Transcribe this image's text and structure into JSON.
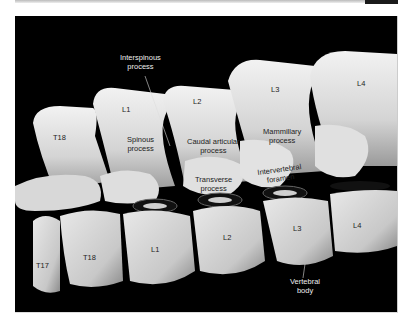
{
  "figure": {
    "type": "3D CT rendering of canine thoracolumbar vertebrae (lateral view)",
    "labels": {
      "interspinous": "Interspinous\nprocess",
      "interspinous_l1": "Interspinous",
      "interspinous_l2": "process",
      "spinous_l1": "Spinous",
      "spinous_l2": "process",
      "caudal_l1": "Caudal articular",
      "caudal_l2": "process",
      "mammillary_l1": "Mammillary",
      "mammillary_l2": "process",
      "transverse_l1": "Transverse",
      "transverse_l2": "process",
      "intervertebral_l1": "Intervertebral",
      "intervertebral_l2": "foramen",
      "vertebral_body_l1": "Vertebral",
      "vertebral_body_l2": "body"
    },
    "vertebrae_spinous": [
      "T18",
      "L1",
      "L2",
      "L3",
      "L4"
    ],
    "vertebrae_body": [
      "T17",
      "T18",
      "L1",
      "L2",
      "L3",
      "L4"
    ],
    "colors": {
      "background": "#000000",
      "bone": "#e6e6e6",
      "bone_shadow": "#8a8a8a",
      "page": "#ffffff"
    }
  }
}
